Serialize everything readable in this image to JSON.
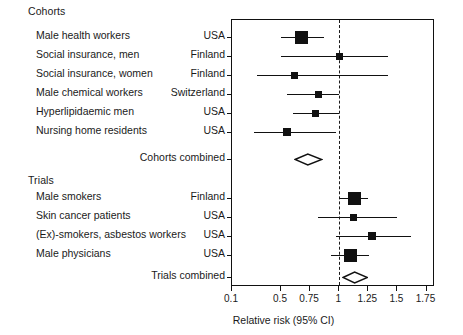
{
  "figure": {
    "type": "forest-plot",
    "axis_title": "Relative risk (95% CI)",
    "null_value": 1
  },
  "sections": [
    {
      "heading": "Cohorts",
      "combined_label": "Cohorts combined"
    },
    {
      "heading": "Trials",
      "combined_label": "Trials combined"
    }
  ],
  "rows": [
    {
      "name": "Male health workers",
      "country": "USA"
    },
    {
      "name": "Social insurance, men",
      "country": "Finland"
    },
    {
      "name": "Social insurance, women",
      "country": "Finland"
    },
    {
      "name": "Male chemical workers",
      "country": "Switzerland"
    },
    {
      "name": "Hyperlipidaemic men",
      "country": "USA"
    },
    {
      "name": "Nursing home residents",
      "country": "USA"
    },
    {
      "name": "Male smokers",
      "country": "Finland"
    },
    {
      "name": "Skin cancer patients",
      "country": "USA"
    },
    {
      "name": "(Ex)-smokers, asbestos workers",
      "country": "USA"
    },
    {
      "name": "Male physicians",
      "country": "USA"
    }
  ],
  "axis": {
    "ticks": [
      0.1,
      0.5,
      0.75,
      1,
      1.25,
      1.5,
      1.75
    ],
    "tick_labels": [
      "0.1",
      "0.5",
      "0.75",
      "1",
      "1.25",
      "1.5",
      "1.75"
    ]
  },
  "chart_data": {
    "type": "forest",
    "title": "",
    "xlabel": "Relative risk (95% CI)",
    "ylabel": "",
    "xlim": [
      0.1,
      1.75
    ],
    "null_line": 1,
    "grid": false,
    "legend": "none",
    "groups": [
      {
        "name": "Cohorts",
        "studies": [
          {
            "label": "Male health workers",
            "country": "USA",
            "rr": 0.68,
            "ci_low": 0.5,
            "ci_high": 0.87,
            "weight": "large"
          },
          {
            "label": "Social insurance, men",
            "country": "Finland",
            "rr": 1.0,
            "ci_low": 0.5,
            "ci_high": 1.42,
            "weight": "small"
          },
          {
            "label": "Social insurance, women",
            "country": "Finland",
            "rr": 0.62,
            "ci_low": 0.3,
            "ci_high": 1.42,
            "weight": "small"
          },
          {
            "label": "Male chemical workers",
            "country": "Switzerland",
            "rr": 0.82,
            "ci_low": 0.55,
            "ci_high": 1.0,
            "weight": "small"
          },
          {
            "label": "Hyperlipidaemic men",
            "country": "USA",
            "rr": 0.8,
            "ci_low": 0.6,
            "ci_high": 1.0,
            "weight": "small"
          },
          {
            "label": "Nursing home residents",
            "country": "USA",
            "rr": 0.55,
            "ci_low": 0.28,
            "ci_high": 0.97,
            "weight": "medium"
          }
        ],
        "combined": {
          "label": "Cohorts combined",
          "rr": 0.73,
          "ci_low": 0.62,
          "ci_high": 0.85
        }
      },
      {
        "name": "Trials",
        "studies": [
          {
            "label": "Male smokers",
            "country": "Finland",
            "rr": 1.13,
            "ci_low": 1.0,
            "ci_high": 1.25,
            "weight": "large"
          },
          {
            "label": "Skin cancer patients",
            "country": "USA",
            "rr": 1.12,
            "ci_low": 0.82,
            "ci_high": 1.5,
            "weight": "small"
          },
          {
            "label": "(Ex)-smokers, asbestos workers",
            "country": "USA",
            "rr": 1.28,
            "ci_low": 0.97,
            "ci_high": 1.62,
            "weight": "medium"
          },
          {
            "label": "Male physicians",
            "country": "USA",
            "rr": 1.1,
            "ci_low": 0.93,
            "ci_high": 1.26,
            "weight": "large"
          }
        ],
        "combined": {
          "label": "Trials combined",
          "rr": 1.13,
          "ci_low": 1.03,
          "ci_high": 1.24
        }
      }
    ]
  },
  "colors": {
    "marker": "#111111",
    "frame": "#111111",
    "text": "#1a1a1a",
    "background": "#ffffff"
  }
}
